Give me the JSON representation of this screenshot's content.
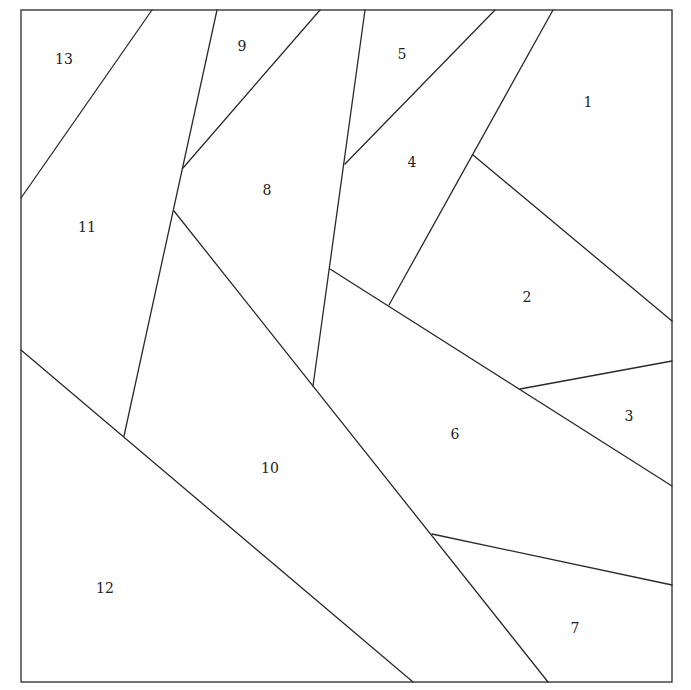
{
  "colors": {
    "line": "#2a2a2a",
    "background": "#ffffff",
    "text": "#222222"
  },
  "regions": [
    {
      "id": "1",
      "label": "1"
    },
    {
      "id": "2",
      "label": "2"
    },
    {
      "id": "3",
      "label": "3"
    },
    {
      "id": "4",
      "label": "4"
    },
    {
      "id": "5",
      "label": "5"
    },
    {
      "id": "6",
      "label": "6"
    },
    {
      "id": "7",
      "label": "7"
    },
    {
      "id": "8",
      "label": "8"
    },
    {
      "id": "9",
      "label": "9"
    },
    {
      "id": "10",
      "label": "10"
    },
    {
      "id": "11",
      "label": "11"
    },
    {
      "id": "12",
      "label": "12"
    },
    {
      "id": "13",
      "label": "13"
    }
  ]
}
